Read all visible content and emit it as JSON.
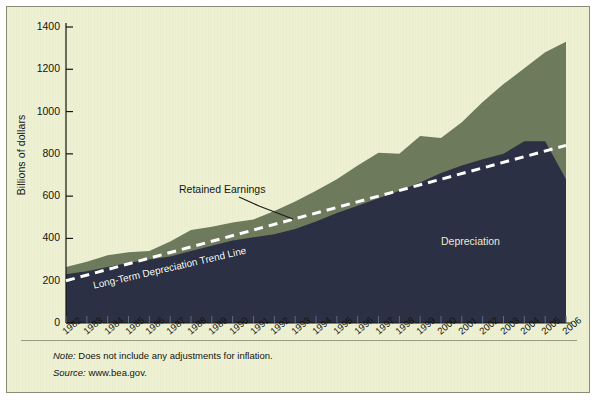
{
  "figure": {
    "y_axis_title": "Billions of dollars",
    "note_prefix": "Note:",
    "note_text": " Does not include any adjustments for inflation.",
    "source_prefix": "Source:",
    "source_text": " www.bea.gov.",
    "background_color": "#eef0d2",
    "depreciation_color": "#2b3044",
    "retained_earnings_color": "#6e7a5c",
    "trend_line_color": "#ffffff",
    "axis_color": "#15150f"
  },
  "chart_data": {
    "type": "area",
    "title": "",
    "subtitle": "",
    "xlabel": "",
    "ylabel": "Billions of dollars",
    "ylim": [
      0,
      1400
    ],
    "ytick_labels": [
      "1400",
      "1200",
      "1000",
      "800",
      "600",
      "400",
      "200",
      "0"
    ],
    "ytick_values": [
      1400,
      1200,
      1000,
      800,
      600,
      400,
      200,
      0
    ],
    "grid": false,
    "legend_position": "inline-annotations",
    "stacked": true,
    "categories": [
      "1982",
      "1983",
      "1984",
      "1985",
      "1986",
      "1987",
      "1988",
      "1989",
      "1990",
      "1991",
      "1992",
      "1993",
      "1994",
      "1995",
      "1996",
      "1997",
      "1998",
      "1999",
      "2000",
      "2001",
      "2002",
      "2003",
      "2004",
      "2005",
      "2006"
    ],
    "series": [
      {
        "name": "Depreciation",
        "color": "#2b3044",
        "values": [
          230,
          245,
          265,
          285,
          300,
          315,
          340,
          365,
          390,
          405,
          420,
          445,
          480,
          520,
          555,
          590,
          625,
          665,
          710,
          745,
          775,
          800,
          860,
          860,
          680
        ]
      },
      {
        "name": "Retained Earnings",
        "color": "#6e7a5c",
        "values": [
          35,
          45,
          55,
          50,
          40,
          70,
          100,
          90,
          85,
          85,
          110,
          130,
          145,
          160,
          190,
          215,
          175,
          220,
          165,
          205,
          270,
          330,
          345,
          420,
          650
        ]
      }
    ],
    "totals": [
      265,
      290,
      320,
      335,
      340,
      385,
      440,
      455,
      475,
      490,
      530,
      575,
      625,
      680,
      745,
      805,
      800,
      885,
      875,
      950,
      1045,
      1130,
      1205,
      1280,
      1330
    ],
    "annotations": [
      {
        "text": "Retained Earnings",
        "kind": "series-label"
      },
      {
        "text": "Depreciation",
        "kind": "series-label"
      },
      {
        "text": "Long-Term Depreciation Trend Line",
        "kind": "trend-label"
      }
    ],
    "trend_line": {
      "name": "Long-Term Depreciation Trend Line",
      "style": "dashed",
      "color": "#ffffff",
      "start": {
        "x": "1982",
        "y": 200
      },
      "end": {
        "x": "2006",
        "y": 840
      }
    }
  }
}
